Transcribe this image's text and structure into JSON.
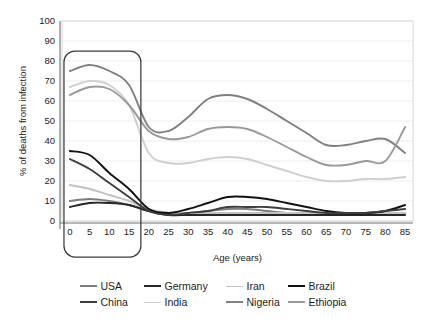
{
  "chart_data": {
    "type": "line",
    "title": "",
    "xlabel": "Age (years)",
    "ylabel": "% of deaths from infection",
    "xlim": [
      -2,
      87
    ],
    "ylim": [
      0,
      100
    ],
    "xticks": [
      0,
      5,
      10,
      15,
      20,
      25,
      30,
      35,
      40,
      45,
      50,
      55,
      60,
      65,
      70,
      75,
      80,
      85
    ],
    "yticks": [
      0,
      10,
      20,
      30,
      40,
      50,
      60,
      70,
      80,
      90,
      100
    ],
    "grid": "horizontal",
    "legend_position": "below",
    "x": [
      0,
      5,
      10,
      15,
      20,
      25,
      30,
      35,
      40,
      45,
      50,
      55,
      60,
      65,
      70,
      75,
      80,
      85
    ],
    "series": [
      {
        "name": "USA",
        "color": "#7d7d7d",
        "values": [
          10,
          11,
          10,
          8,
          5,
          4,
          4,
          5,
          6,
          6,
          5,
          4,
          4,
          4,
          4,
          4,
          4,
          4
        ]
      },
      {
        "name": "Germany",
        "color": "#262626",
        "values": [
          7,
          9,
          9,
          8,
          5,
          3,
          3,
          3,
          3,
          3,
          3,
          3,
          3,
          3,
          3,
          3,
          3,
          3
        ]
      },
      {
        "name": "Iran",
        "color": "#c2c2c2",
        "values": [
          18,
          16,
          13,
          10,
          6,
          4,
          4,
          4,
          4,
          4,
          4,
          4,
          4,
          4,
          4,
          4,
          4,
          4
        ]
      },
      {
        "name": "Brazil",
        "color": "#111111",
        "values": [
          35,
          33,
          24,
          16,
          6,
          4,
          6,
          9,
          12,
          12,
          11,
          9,
          7,
          5,
          4,
          4,
          5,
          8
        ]
      },
      {
        "name": "China",
        "color": "#3d3d3d",
        "values": [
          31,
          26,
          19,
          12,
          5,
          3,
          4,
          5,
          7,
          7,
          7,
          6,
          5,
          4,
          4,
          4,
          5,
          6
        ]
      },
      {
        "name": "India",
        "color": "#cfcfcf",
        "values": [
          67,
          70,
          68,
          58,
          34,
          29,
          29,
          31,
          32,
          31,
          28,
          25,
          22,
          20,
          20,
          21,
          21,
          22
        ]
      },
      {
        "name": "Nigeria",
        "color": "#808080",
        "values": [
          75,
          78,
          75,
          68,
          47,
          45,
          52,
          61,
          63,
          61,
          56,
          50,
          44,
          38,
          38,
          40,
          41,
          34
        ]
      },
      {
        "name": "Ethiopia",
        "color": "#999999",
        "values": [
          63,
          67,
          66,
          58,
          45,
          41,
          42,
          46,
          47,
          46,
          42,
          37,
          32,
          28,
          28,
          30,
          30,
          47
        ]
      }
    ],
    "highlight_box": {
      "x_start": -1.5,
      "x_end": 18,
      "y_top": 85,
      "label": "early-childhood-highlight"
    }
  },
  "legend": {
    "rows": [
      [
        {
          "label": "USA",
          "color": "#7d7d7d",
          "weight": 2.0
        },
        {
          "label": "Germany",
          "color": "#262626",
          "weight": 2.4
        },
        {
          "label": "Iran",
          "color": "#c2c2c2",
          "weight": 1.8
        },
        {
          "label": "Brazil",
          "color": "#111111",
          "weight": 2.6
        }
      ],
      [
        {
          "label": "China",
          "color": "#3d3d3d",
          "weight": 2.4
        },
        {
          "label": "India",
          "color": "#cfcfcf",
          "weight": 1.8
        },
        {
          "label": "Nigeria",
          "color": "#808080",
          "weight": 2.0
        },
        {
          "label": "Ethiopia",
          "color": "#999999",
          "weight": 2.0
        }
      ]
    ]
  }
}
